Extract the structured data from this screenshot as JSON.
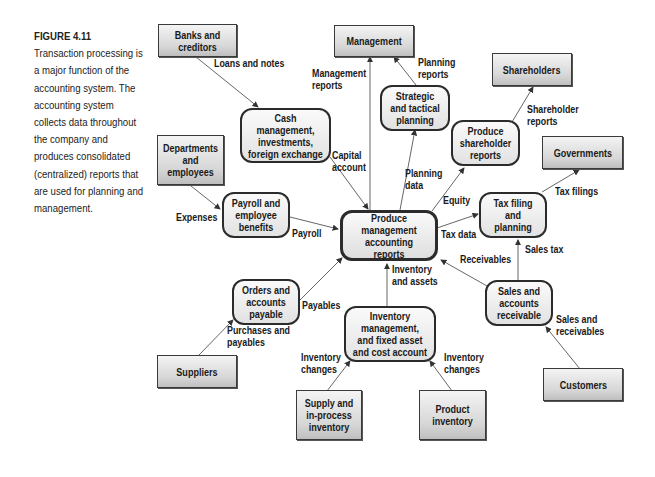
{
  "caption": {
    "figure_label": "FIGURE 4.11",
    "text": "Transaction processing is a major function of the accounting system. The accounting system collects data throughout the company and produces consolidated (centralized) reports that are used for planning and management."
  },
  "external_entities": {
    "banks": "Banks and creditors",
    "management": "Management",
    "shareholders": "Shareholders",
    "governments": "Governments",
    "departments": "Departments and employees",
    "suppliers": "Suppliers",
    "customers": "Customers",
    "supply_inventory": "Supply and in-process inventory",
    "product_inventory": "Product inventory"
  },
  "processes": {
    "central": "Produce management accounting reports",
    "cash": "Cash management, investments, foreign exchange",
    "strategic": "Strategic and tactical planning",
    "shareholder_reports": "Produce shareholder reports",
    "tax": "Tax filing and planning",
    "payroll": "Payroll and employee benefits",
    "orders": "Orders and accounts payable",
    "sales": "Sales and accounts receivable",
    "inventory": "Inventory management, and fixed asset and cost account"
  },
  "flows": {
    "loans_notes": "Loans and notes",
    "management_reports": "Management\nreports",
    "planning_reports": "Planning\nreports",
    "shareholder_reports": "Shareholder\nreports",
    "capital_account": "Capital\naccount",
    "planning_data": "Planning\ndata",
    "equity": "Equity",
    "tax_filings": "Tax filings",
    "expenses": "Expenses",
    "payroll": "Payroll",
    "tax_data": "Tax data",
    "sales_tax": "Sales tax",
    "receivables": "Receivables",
    "inventory_assets": "Inventory\nand assets",
    "payables": "Payables",
    "purchases_payables": "Purchases and\npayables",
    "sales_receivables": "Sales and\nreceivables",
    "inventory_changes_left": "Inventory\nchanges",
    "inventory_changes_right": "Inventory\nchanges"
  }
}
